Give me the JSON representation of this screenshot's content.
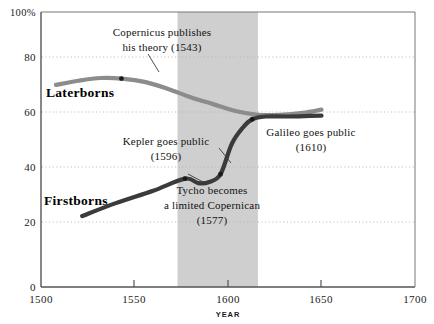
{
  "chart_data": {
    "type": "line",
    "title": "",
    "subtitle": "",
    "xlabel": "YEAR",
    "ylabel": "",
    "xlim": [
      1500,
      1700
    ],
    "ylim": [
      0,
      100
    ],
    "grid": "horizontal-dotted",
    "legend": "inline-labels",
    "x_ticks": [
      "1500",
      "1550",
      "1600",
      "1650",
      "1700"
    ],
    "x_tick_values": [
      1500,
      1550,
      1600,
      1650,
      1700
    ],
    "y_ticks": [
      "0",
      "20",
      "40",
      "60",
      "80",
      "100%"
    ],
    "y_tick_values": [
      0,
      20,
      40,
      60,
      80,
      100
    ],
    "shaded_band": {
      "label": "",
      "x_start": 1573,
      "x_end": 1616,
      "color": "#cfcfcf"
    },
    "series": [
      {
        "name": "Laterborns",
        "color": "#8c8c8c",
        "label_x": 1527,
        "label_y": 70,
        "points": [
          [
            1508,
            73.5
          ],
          [
            1520,
            75.0
          ],
          [
            1532,
            76.0
          ],
          [
            1543,
            75.8
          ],
          [
            1556,
            74.5
          ],
          [
            1568,
            72.0
          ],
          [
            1580,
            69.0
          ],
          [
            1592,
            66.5
          ],
          [
            1604,
            64.0
          ],
          [
            1616,
            62.6
          ],
          [
            1628,
            62.6
          ],
          [
            1640,
            63.3
          ],
          [
            1650,
            64.5
          ]
        ]
      },
      {
        "name": "Firstborns",
        "color": "#3b3b3b",
        "label_x": 1516,
        "label_y": 34,
        "points": [
          [
            1522,
            25.8
          ],
          [
            1540,
            30.5
          ],
          [
            1560,
            35.0
          ],
          [
            1577,
            39.4
          ],
          [
            1584,
            37.8
          ],
          [
            1590,
            38.2
          ],
          [
            1596,
            41.0
          ],
          [
            1602,
            52.0
          ],
          [
            1608,
            58.0
          ],
          [
            1613,
            61.0
          ],
          [
            1620,
            62.0
          ],
          [
            1632,
            62.0
          ],
          [
            1644,
            62.2
          ],
          [
            1650,
            62.3
          ]
        ]
      }
    ],
    "markers": [
      {
        "name": "copernicus-marker",
        "x": 1543,
        "y": 75.8
      },
      {
        "name": "tycho-marker",
        "x": 1577,
        "y": 39.4
      },
      {
        "name": "kepler-marker",
        "x": 1596,
        "y": 41.0
      },
      {
        "name": "galileo-marker",
        "x": 1613,
        "y": 61.0
      }
    ],
    "annotations": [
      {
        "name": "copernicus-annotation",
        "lines": [
          "Copernicus publishes",
          "his theory (1543)"
        ],
        "line1": "Copernicus publishes",
        "line2": "his theory (1543)",
        "anchor": "middle",
        "text_x": 1565,
        "text_y": 94,
        "leader_to": [
          1543,
          75.8
        ]
      },
      {
        "name": "kepler-annotation",
        "lines": [
          "Kepler goes public",
          "(1596)"
        ],
        "line1": "Kepler goes public",
        "line2": "(1596)",
        "anchor": "middle",
        "text_x": 1588,
        "text_y": 52,
        "leader_to": [
          1596,
          41.0
        ]
      },
      {
        "name": "tycho-annotation",
        "lines": [
          "Tycho becomes",
          "a limited Copernican",
          "(1577)"
        ],
        "line1": "Tycho becomes",
        "line2": "a limited Copernican",
        "line3": "(1577)",
        "anchor": "middle",
        "text_x": 1614,
        "text_y": 34,
        "leader_to": [
          1577,
          39.4
        ]
      },
      {
        "name": "galileo-annotation",
        "lines": [
          "Galileo goes public",
          "(1610)"
        ],
        "line1": "Galileo goes public",
        "line2": "(1610)",
        "anchor": "middle",
        "text_x": 1646,
        "text_y": 54,
        "leader_to": [
          1613,
          61.0
        ]
      }
    ],
    "colors": {
      "laterborns": "#8c8c8c",
      "firstborns": "#3b3b3b",
      "band": "#cfcfcf",
      "axis": "#555555",
      "grid": "#bbbbbb",
      "text": "#111111"
    }
  },
  "axis": {
    "y": {
      "t0": "0",
      "t20": "20",
      "t40": "40",
      "t60": "60",
      "t80": "80",
      "t100": "100%"
    },
    "x": {
      "t1500": "1500",
      "t1550": "1550",
      "t1600": "1600",
      "t1650": "1650",
      "t1700": "1700",
      "title": "YEAR"
    }
  },
  "series_labels": {
    "laterborns": "Laterborns",
    "firstborns": "Firstborns"
  },
  "annotations_text": {
    "copernicus_l1": "Copernicus publishes",
    "copernicus_l2": "his theory (1543)",
    "kepler_l1": "Kepler goes public",
    "kepler_l2": "(1596)",
    "tycho_l1": "Tycho becomes",
    "tycho_l2": "a limited Copernican",
    "tycho_l3": "(1577)",
    "galileo_l1": "Galileo goes public",
    "galileo_l2": "(1610)"
  }
}
